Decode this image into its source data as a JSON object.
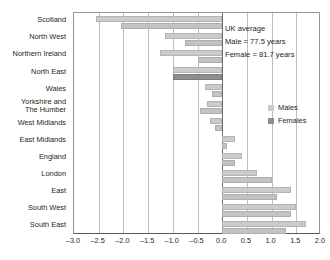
{
  "chart_data": {
    "type": "bar",
    "orientation": "horizontal",
    "title": "",
    "xlabel": "",
    "ylabel": "",
    "xlim": [
      -3.0,
      2.0
    ],
    "xticks": [
      "-3.0",
      "-2.5",
      "-2.0",
      "-1.5",
      "-1.0",
      "-0.5",
      "0.0",
      "0.5",
      "1.0",
      "1.5",
      "2.0"
    ],
    "xtick_values": [
      -3.0,
      -2.5,
      -2.0,
      -1.5,
      -1.0,
      -0.5,
      0.0,
      0.5,
      1.0,
      1.5,
      2.0
    ],
    "grid": true,
    "legend_position": "right",
    "categories": [
      "Scotland",
      "North West",
      "Northern Ireland",
      "North East",
      "Wales",
      "Yorkshire and\nThe Humber",
      "West Midlands",
      "East Midlands",
      "England",
      "London",
      "East",
      "South West",
      "South East"
    ],
    "series": [
      {
        "name": "Males",
        "color": "#cbcbcb",
        "values": [
          -2.55,
          -1.15,
          -1.25,
          -1.0,
          -0.35,
          -0.3,
          -0.25,
          0.25,
          0.4,
          0.7,
          1.4,
          1.5,
          1.7
        ]
      },
      {
        "name": "Females",
        "color": "#8d8d8d",
        "values": [
          -2.05,
          -0.75,
          -0.5,
          -1.0,
          -0.2,
          -0.45,
          -0.15,
          0.1,
          0.25,
          1.0,
          1.1,
          1.4,
          1.3
        ]
      }
    ],
    "annotations": [
      "UK average",
      "Male = 77.5 years",
      "Female = 81.7 years"
    ],
    "legend": [
      {
        "label": "Males",
        "color": "#cbcbcb"
      },
      {
        "label": "Females",
        "color": "#8d8d8d"
      }
    ]
  }
}
